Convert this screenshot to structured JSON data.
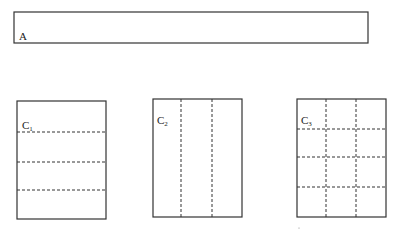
{
  "diagram": {
    "rect_a": {
      "label": "A",
      "x": 14,
      "y": 12,
      "w": 354,
      "h": 31
    },
    "panels": [
      {
        "id": "C1",
        "label_main": "C",
        "label_sub": "1",
        "x": 17,
        "y": 101,
        "w": 89,
        "h": 118,
        "vertical_dashes": [],
        "horizontal_dashes": [
          132,
          162,
          190
        ]
      },
      {
        "id": "C2",
        "label_main": "C",
        "label_sub": "2",
        "x": 153,
        "y": 99,
        "w": 89,
        "h": 118,
        "vertical_dashes": [
          181,
          212
        ],
        "horizontal_dashes": []
      },
      {
        "id": "C3",
        "label_main": "C",
        "label_sub": "3",
        "x": 297,
        "y": 99,
        "w": 89,
        "h": 118,
        "vertical_dashes": [
          326,
          356
        ],
        "horizontal_dashes": [
          129,
          157,
          187
        ]
      }
    ],
    "stroke_color": "#333333"
  }
}
